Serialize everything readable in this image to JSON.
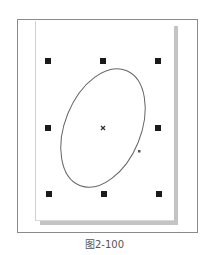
{
  "figure": {
    "caption": "图2-100"
  },
  "canvas": {
    "page_color": "#ffffff",
    "shadow_color": "#c4c4c4",
    "frame_color": "#8a8a8a"
  },
  "selection": {
    "handle_color": "#1a1a1a",
    "handles": [
      {
        "id": "top-left",
        "x": 48,
        "y": 61
      },
      {
        "id": "top-center",
        "x": 103,
        "y": 61
      },
      {
        "id": "top-right",
        "x": 158,
        "y": 61
      },
      {
        "id": "middle-left",
        "x": 48,
        "y": 128
      },
      {
        "id": "middle-right",
        "x": 158,
        "y": 128
      },
      {
        "id": "bottom-left",
        "x": 49,
        "y": 194
      },
      {
        "id": "bottom-center",
        "x": 104,
        "y": 194
      },
      {
        "id": "bottom-right",
        "x": 159,
        "y": 194
      }
    ],
    "center_marker": {
      "x": 103,
      "y": 128,
      "symbol": "×"
    }
  },
  "ellipse": {
    "cx": 103,
    "cy": 128,
    "rx": 38,
    "ry": 62,
    "rotation_deg": 22,
    "stroke": "#666666",
    "node": {
      "x": 139,
      "y": 151
    }
  }
}
